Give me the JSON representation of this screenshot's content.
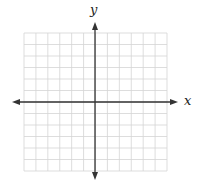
{
  "figure": {
    "type": "blank coordinate plane",
    "x_axis_label": "x",
    "y_axis_label": "y",
    "grid": {
      "columns": 12,
      "rows": 12,
      "left": 24,
      "top": 33,
      "right": 167,
      "bottom": 171,
      "line_color": "#d4d4d4"
    },
    "axes": {
      "origin_x": 95,
      "origin_y": 102,
      "x_start": 12,
      "x_end": 178,
      "y_start": 22,
      "y_end": 180,
      "color": "#333333"
    },
    "colors": {
      "background": "#ffffff",
      "axis": "#333333",
      "grid": "#d4d4d4",
      "label": "#222222"
    }
  }
}
